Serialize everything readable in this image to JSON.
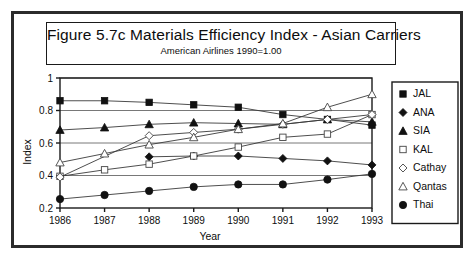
{
  "figure": {
    "title": "Figure 5.7c  Materials Efficiency Index - Asian Carriers",
    "subtitle": "American Airlines 1990=1.00"
  },
  "axes": {
    "xlabel": "Year",
    "ylabel": "Index",
    "y_ticks": [
      "0.2",
      "0.4",
      "0.6",
      "0.8",
      "1"
    ],
    "x_ticks": [
      "1986",
      "1987",
      "1988",
      "1989",
      "1990",
      "1991",
      "1992",
      "1993"
    ]
  },
  "legend": {
    "items": [
      {
        "label": "JAL",
        "marker": "filled-square-icon"
      },
      {
        "label": "ANA",
        "marker": "filled-diamond-icon"
      },
      {
        "label": "SIA",
        "marker": "filled-triangle-icon"
      },
      {
        "label": "KAL",
        "marker": "open-square-icon"
      },
      {
        "label": "Cathay",
        "marker": "open-diamond-icon"
      },
      {
        "label": "Qantas",
        "marker": "open-triangle-icon"
      },
      {
        "label": "Thai",
        "marker": "filled-circle-icon"
      }
    ]
  },
  "chart_data": {
    "type": "line",
    "title": "Figure 5.7c  Materials Efficiency Index - Asian Carriers",
    "subtitle": "American Airlines 1990=1.00",
    "xlabel": "Year",
    "ylabel": "Index",
    "x": [
      1986,
      1987,
      1988,
      1989,
      1990,
      1991,
      1992,
      1993
    ],
    "xlim": [
      1986,
      1993
    ],
    "ylim": [
      0.2,
      1.0
    ],
    "yticks": [
      0.2,
      0.4,
      0.6,
      0.8,
      1.0
    ],
    "grid": "horizontal",
    "legend_position": "right-outside",
    "series": [
      {
        "name": "JAL",
        "marker": "filled-square",
        "values": [
          0.86,
          0.86,
          0.85,
          0.835,
          0.82,
          0.775,
          0.745,
          0.71
        ]
      },
      {
        "name": "ANA",
        "marker": "filled-diamond",
        "values": [
          null,
          null,
          0.515,
          0.52,
          0.52,
          0.505,
          0.49,
          0.465
        ]
      },
      {
        "name": "SIA",
        "marker": "filled-triangle",
        "values": [
          0.68,
          0.695,
          0.715,
          0.725,
          0.72,
          0.715,
          0.745,
          0.73
        ]
      },
      {
        "name": "KAL",
        "marker": "open-square",
        "values": [
          0.395,
          0.435,
          0.47,
          0.52,
          0.575,
          0.635,
          0.655,
          0.775
        ]
      },
      {
        "name": "Cathay",
        "marker": "open-diamond",
        "values": [
          0.39,
          null,
          0.645,
          0.665,
          0.685,
          0.715,
          0.745,
          0.775
        ]
      },
      {
        "name": "Qantas",
        "marker": "open-triangle",
        "values": [
          0.48,
          0.535,
          0.59,
          0.635,
          0.685,
          0.72,
          0.82,
          0.9
        ]
      },
      {
        "name": "Thai",
        "marker": "filled-circle",
        "values": [
          0.255,
          0.28,
          0.305,
          0.33,
          0.345,
          0.345,
          0.375,
          0.41
        ]
      }
    ]
  },
  "colors": {
    "frame": "#2b2b2b",
    "ink": "#111111",
    "grid": "#555555",
    "background": "#ffffff"
  }
}
